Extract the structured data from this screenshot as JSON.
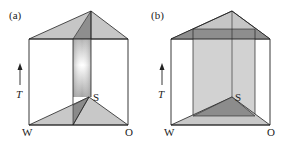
{
  "panels": [
    {
      "label": "(a)",
      "axis_label": "T",
      "vertices": {
        "left": "W",
        "back": "S",
        "right": "O"
      }
    },
    {
      "label": "(b)",
      "axis_label": "T",
      "vertices": {
        "left": "W",
        "back": "S",
        "right": "O"
      }
    }
  ],
  "colors": {
    "outline": "#222222",
    "fill_light": "#c8c8c8",
    "fill_mid": "#a8a8a8",
    "fill_dark": "#8a8a8a"
  }
}
